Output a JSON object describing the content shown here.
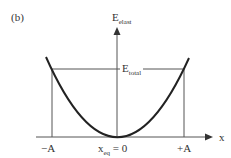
{
  "panel_label": "(b)",
  "y_axis": {
    "label_main": "E",
    "label_sub": "elast"
  },
  "x_axis": {
    "label": "x"
  },
  "energy_line": {
    "label_main": "E",
    "label_sub": "total"
  },
  "ticks": {
    "left": "−A",
    "center_main": "x",
    "center_sub": "eq",
    "center_rest": " = 0",
    "right": "+A"
  },
  "colors": {
    "curve": "#222222",
    "lines": "#555555"
  }
}
